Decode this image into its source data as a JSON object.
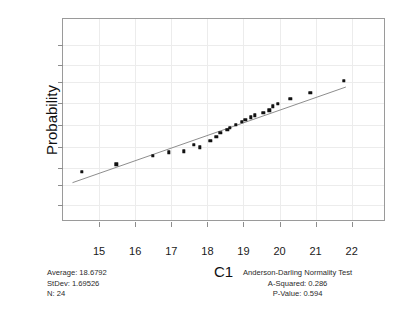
{
  "chart_data": {
    "type": "scatter",
    "title": "",
    "xlabel": "C1",
    "ylabel": "Probability",
    "xlim": [
      14.0,
      22.95
    ],
    "xticks": [
      "15",
      "16",
      "17",
      "18",
      "19",
      "20",
      "21",
      "22"
    ],
    "xtick_values": [
      15,
      16,
      17,
      18,
      19,
      20,
      21,
      22
    ],
    "ytick_labels": [
      ".999",
      ".99",
      ".95",
      ".80",
      ".50",
      ".20",
      ".05",
      ".01",
      ".001"
    ],
    "ytick_values": [
      0.999,
      0.99,
      0.95,
      0.8,
      0.5,
      0.2,
      0.05,
      0.01,
      0.001
    ],
    "y_scale": "normal-probability",
    "grid": true,
    "legend": "none",
    "x": [
      14.52,
      15.48,
      16.48,
      16.93,
      17.34,
      17.62,
      17.8,
      18.08,
      18.25,
      18.36,
      18.55,
      18.63,
      18.78,
      18.95,
      19.05,
      19.2,
      19.32,
      19.55,
      19.72,
      19.82,
      19.95,
      20.3,
      20.85,
      21.78
    ],
    "y": [
      0.035,
      0.065,
      0.115,
      0.145,
      0.155,
      0.225,
      0.195,
      0.275,
      0.325,
      0.385,
      0.425,
      0.455,
      0.505,
      0.545,
      0.575,
      0.615,
      0.645,
      0.685,
      0.715,
      0.765,
      0.795,
      0.845,
      0.895,
      0.955
    ],
    "fit_line": {
      "x_start": 14.25,
      "y_start": 0.011,
      "x_end": 21.9,
      "y_end": 0.925,
      "color": "#8c8c8c"
    },
    "marker_color": "#111111",
    "n_points": 24
  },
  "stats_left": {
    "average_label": "Average: 18.6792",
    "stdev_label": "StDev: 1.69526",
    "n_label": "N: 24"
  },
  "stats_right": {
    "test_title": "Anderson-Darling Normality Test",
    "a_squared": "A-Squared: 0.286",
    "p_value": "P-Value:  0.594"
  },
  "colors": {
    "frame": "#9a9a9a",
    "grid": "#ececec",
    "marker": "#111111",
    "fit": "#8c8c8c"
  }
}
